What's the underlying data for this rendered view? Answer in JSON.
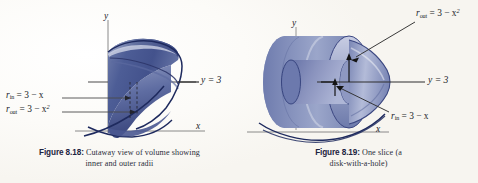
{
  "page": {
    "background": "#fbfaf7",
    "ink": "#1b1d28",
    "solid_dark": "#3e4c82",
    "solid_mid": "#5a6ba0",
    "solid_light": "#95a0c4",
    "outline": "#232c5c"
  },
  "figures": [
    {
      "id": "8.18",
      "caption_number": "Figure 8.18:",
      "caption_line1": "Cutaway view of volume showing",
      "caption_line2": "inner and outer radii",
      "axes": {
        "y_label": "y",
        "x_label": "x"
      },
      "labels": [
        {
          "name": "y-equals-3",
          "text": "y = 3"
        },
        {
          "name": "r-in",
          "var": "r",
          "sub": "in",
          "body": " = 3 − x"
        },
        {
          "name": "r-out",
          "var": "r",
          "sub": "out",
          "body": " = 3 − x",
          "sup": "2"
        }
      ]
    },
    {
      "id": "8.19",
      "caption_number": "Figure 8.19:",
      "caption_line1": "One slice (a",
      "caption_line2": "disk-with-a-hole)",
      "axes": {
        "y_label": "y",
        "x_label": "x"
      },
      "labels": [
        {
          "name": "y-equals-3",
          "text": "y = 3"
        },
        {
          "name": "r-out",
          "var": "r",
          "sub": "out",
          "body": " = 3 − x",
          "sup": "2"
        },
        {
          "name": "r-in",
          "var": "r",
          "sub": "in",
          "body": " = 3 − x"
        }
      ]
    }
  ],
  "text": {
    "fig18_number": "Figure 8.18:",
    "fig18_l1": "Cutaway view of volume showing",
    "fig18_l2": "inner and outer radii",
    "fig19_number": "Figure 8.19:",
    "fig19_l1": "One slice (a",
    "fig19_l2": "disk-with-a-hole)",
    "y": "y",
    "x": "x",
    "y3": "y = 3",
    "r": "r",
    "sub_in": "in",
    "sub_out": "out",
    "eq_3_minus_x": " = 3 − x",
    "eq_3_minus_x2": " = 3 − x",
    "sup2": "2"
  }
}
